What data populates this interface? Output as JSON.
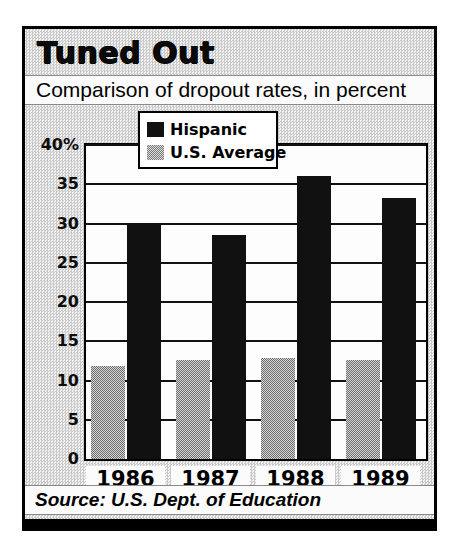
{
  "title": "Tuned Out",
  "subtitle": "Comparison of dropout rates, in percent",
  "source": "Source: U.S. Dept. of Education",
  "legend": {
    "items": [
      {
        "label": "Hispanic",
        "swatch": "black"
      },
      {
        "label": "U.S. Average",
        "swatch": "gray"
      }
    ]
  },
  "colors": {
    "hispanic": "#111111",
    "us_average": "#9a9a9a",
    "background": "#cfcfcf",
    "plot_background": "#fdfdfd",
    "frame": "#000000"
  },
  "chart_data": {
    "type": "bar",
    "title": "Tuned Out",
    "subtitle": "Comparison of dropout rates, in percent",
    "xlabel": "",
    "ylabel": "",
    "ylim": [
      0,
      40
    ],
    "yticks": [
      "40%",
      "35",
      "30",
      "25",
      "20",
      "15",
      "10",
      "5",
      "0"
    ],
    "ytick_values": [
      40,
      35,
      30,
      25,
      20,
      15,
      10,
      5,
      0
    ],
    "grid": true,
    "legend_position": "top-center",
    "categories": [
      "1986",
      "1987",
      "1988",
      "1989"
    ],
    "series": [
      {
        "name": "U.S. Average",
        "values": [
          11.9,
          12.6,
          12.9,
          12.6
        ],
        "color": "#9a9a9a"
      },
      {
        "name": "Hispanic",
        "values": [
          29.8,
          28.5,
          36.0,
          33.2
        ],
        "color": "#111111"
      }
    ],
    "source": "Source: U.S. Dept. of Education"
  }
}
